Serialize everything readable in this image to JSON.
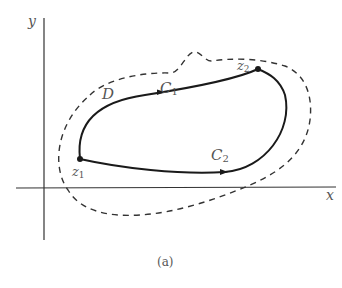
{
  "figure": {
    "caption": "(a)",
    "axes": {
      "x_label": "x",
      "y_label": "y"
    },
    "region": {
      "label": "D",
      "style": "dashed"
    },
    "curves": [
      {
        "label_main": "C",
        "label_sub": "1",
        "from": "z1",
        "to": "z2",
        "direction_arrow": true
      },
      {
        "label_main": "C",
        "label_sub": "2",
        "from": "z1",
        "to": "z2",
        "direction_arrow": true
      }
    ],
    "points": [
      {
        "label_main": "z",
        "label_sub": "1"
      },
      {
        "label_main": "z",
        "label_sub": "2"
      }
    ],
    "colors": {
      "stroke": "#1a1a1a",
      "axis": "#333333",
      "text": "#555555",
      "background": "#ffffff"
    }
  }
}
